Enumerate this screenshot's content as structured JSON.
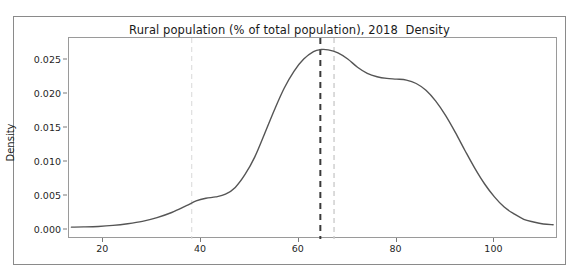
{
  "chart_data": {
    "type": "line",
    "title": "Rural population (% of total population), 2018  Density",
    "xlabel": "",
    "ylabel": "Density",
    "xlim": [
      13,
      113
    ],
    "ylim": [
      -0.0013,
      0.0283
    ],
    "grid": false,
    "legend": null,
    "xticks": [
      20,
      40,
      60,
      80,
      100
    ],
    "xtick_labels": [
      "20",
      "40",
      "60",
      "80",
      "100"
    ],
    "yticks": [
      0.0,
      0.005,
      0.01,
      0.015,
      0.02,
      0.025
    ],
    "ytick_labels": [
      "0.000",
      "0.005",
      "0.010",
      "0.015",
      "0.020",
      "0.025"
    ],
    "series": [
      {
        "name": "Density",
        "color": "#555555",
        "x": [
          13.5,
          16,
          19,
          22,
          25,
          28,
          31,
          34,
          37,
          39,
          41,
          43,
          45,
          47,
          49,
          51,
          53,
          55,
          57,
          59,
          61,
          63,
          64.5,
          66,
          68,
          70,
          72,
          74,
          76,
          78,
          80,
          82,
          84,
          86,
          88,
          90,
          92,
          94,
          96,
          98,
          100,
          102,
          104,
          106,
          108,
          110,
          112
        ],
        "y": [
          0.00045,
          0.00048,
          0.00055,
          0.0007,
          0.00095,
          0.0013,
          0.00185,
          0.0026,
          0.0036,
          0.0043,
          0.0047,
          0.0049,
          0.0053,
          0.0063,
          0.0082,
          0.0108,
          0.0142,
          0.0177,
          0.0209,
          0.0234,
          0.0252,
          0.0263,
          0.0266,
          0.02655,
          0.0261,
          0.0252,
          0.024,
          0.0231,
          0.0226,
          0.02235,
          0.02225,
          0.0221,
          0.0216,
          0.0206,
          0.019,
          0.0169,
          0.0144,
          0.0117,
          0.0091,
          0.0068,
          0.0049,
          0.0034,
          0.0024,
          0.0016,
          0.0012,
          0.0009,
          0.0008
        ]
      }
    ],
    "vlines": [
      {
        "name": "faint-left-reference",
        "x": 38.1,
        "color": "#d8d8d8",
        "style": "dashed",
        "width": 1
      },
      {
        "name": "mean-reference",
        "x": 64.4,
        "color": "#3a3a3a",
        "style": "dashed",
        "width": 2
      },
      {
        "name": "median-reference",
        "x": 67.2,
        "color": "#cccccc",
        "style": "dashed",
        "width": 1.4
      }
    ]
  }
}
